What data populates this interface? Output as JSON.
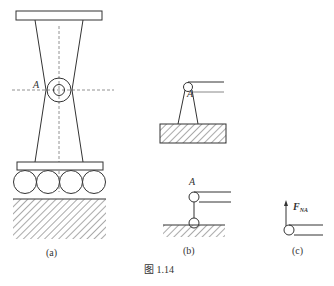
{
  "figure": {
    "caption": "图 1.14",
    "panels": {
      "a": {
        "label": "(a)",
        "point_label": "A"
      },
      "b_upper": {
        "point_label": "A"
      },
      "b_lower": {
        "label": "(b)",
        "point_label": "A"
      },
      "c": {
        "label": "(c)",
        "force_label": "F",
        "force_subscript": "NA"
      }
    }
  },
  "colors": {
    "line": "#333333",
    "dashed": "#777777",
    "hatch": "#555555"
  }
}
